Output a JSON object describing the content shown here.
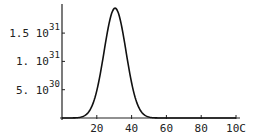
{
  "chart_data": {
    "type": "line",
    "title": "",
    "xlabel": "",
    "ylabel": "",
    "xlim": [
      0,
      100
    ],
    "ylim": [
      0,
      2e+31
    ],
    "grid": false,
    "legend": null,
    "x_ticks": [
      {
        "value": 20,
        "label": "20"
      },
      {
        "value": 40,
        "label": "40"
      },
      {
        "value": 60,
        "label": "60"
      },
      {
        "value": 80,
        "label": "80"
      },
      {
        "value": 100,
        "label": "10C"
      }
    ],
    "y_ticks": [
      {
        "value": 5e+30,
        "mantissa": "5. 10",
        "exponent": "30"
      },
      {
        "value": 1e+31,
        "mantissa": "1. 10",
        "exponent": "31"
      },
      {
        "value": 1.5e+31,
        "mantissa": "1.5 10",
        "exponent": "31"
      }
    ],
    "series": [
      {
        "name": "curve",
        "description": "Bell-shaped peak centered near x=30",
        "peak_x": 30.5,
        "peak_y": 1.94e+31,
        "x": [
          0,
          10,
          15,
          17,
          20,
          22,
          24,
          26,
          28,
          30,
          31,
          32,
          34,
          36,
          38,
          40,
          42,
          44,
          46,
          48,
          50,
          55,
          60,
          80,
          100
        ],
        "y": [
          0,
          0,
          0,
          1e+29,
          1.2e+30,
          3.5e+30,
          7.5e+30,
          1.25e+31,
          1.7e+31,
          1.93e+31,
          1.94e+31,
          1.9e+31,
          1.7e+31,
          1.35e+31,
          9.5e+30,
          5.8e+30,
          3e+30,
          1.3e+30,
          5e+29,
          1.5e+29,
          5e+28,
          0,
          0,
          0,
          0
        ]
      }
    ]
  }
}
